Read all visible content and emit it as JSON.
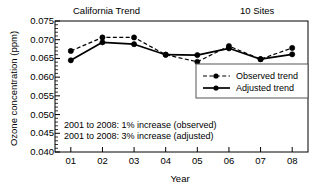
{
  "chart_data": {
    "type": "line",
    "title": "California Trend",
    "title_right": "10 Sites",
    "xlabel": "Year",
    "ylabel": "Ozone concentration (ppm)",
    "categories": [
      "01",
      "02",
      "03",
      "04",
      "05",
      "06",
      "07",
      "08"
    ],
    "xtick_labels": [
      "01",
      "02",
      "03",
      "04",
      "05",
      "06",
      "07",
      "08"
    ],
    "ytick_labels": [
      "0.075",
      "0.070",
      "0.065",
      "0.060",
      "0.055",
      "0.050",
      "0.045",
      "0.040"
    ],
    "ytick_values": [
      0.075,
      0.07,
      0.065,
      0.06,
      0.055,
      0.05,
      0.045,
      0.04
    ],
    "ylim": [
      0.04,
      0.075
    ],
    "xlim": [
      0.5,
      8.5
    ],
    "grid": false,
    "minor_ticks_y": true,
    "legend_position": "center-right",
    "series": [
      {
        "name": "Observed trend",
        "style": "dashed",
        "marker": "filled-circle",
        "color": "#000000",
        "values": [
          0.067,
          0.0706,
          0.0706,
          0.066,
          0.0641,
          0.0683,
          0.0648,
          0.0678
        ]
      },
      {
        "name": "Adjusted trend",
        "style": "solid",
        "marker": "filled-circle",
        "color": "#000000",
        "values": [
          0.0645,
          0.0693,
          0.0688,
          0.066,
          0.0659,
          0.0677,
          0.0648,
          0.0661
        ]
      }
    ],
    "annotations": [
      "2001 to 2008: 1% increase (observed)",
      "2001 to 2008: 3% increase (adjusted)"
    ]
  }
}
